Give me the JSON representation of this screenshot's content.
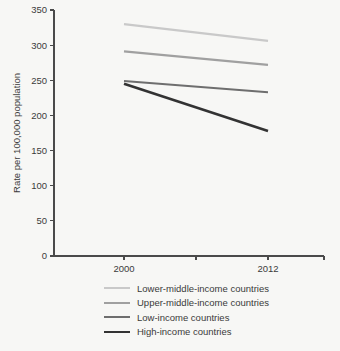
{
  "chart_data": {
    "type": "line",
    "title": "",
    "xlabel": "",
    "ylabel": "Rate per 100,000 population",
    "x": [
      "2000",
      "2012"
    ],
    "xtick_labels": [
      "2000",
      "2012"
    ],
    "ytick_labels": [
      "0",
      "50",
      "100",
      "150",
      "200",
      "250",
      "300",
      "350"
    ],
    "yticks": [
      0,
      50,
      100,
      150,
      200,
      250,
      300,
      350
    ],
    "ylim": [
      0,
      350
    ],
    "grid": false,
    "legend_position": "bottom",
    "series": [
      {
        "name": "Lower-middle-income countries",
        "values": [
          330,
          306
        ],
        "color": "#c9c9c9",
        "width": 2.2
      },
      {
        "name": "Upper-middle-income countries",
        "values": [
          291,
          272
        ],
        "color": "#a0a0a0",
        "width": 2.2
      },
      {
        "name": "Low-income countries",
        "values": [
          249,
          233
        ],
        "color": "#6e6e6e",
        "width": 2.2
      },
      {
        "name": "High-income countries",
        "values": [
          245,
          178
        ],
        "color": "#333333",
        "width": 2.6
      }
    ]
  },
  "legend": {
    "items": [
      {
        "label": "Lower-middle-income countries"
      },
      {
        "label": "Upper-middle-income countries"
      },
      {
        "label": "Low-income countries"
      },
      {
        "label": "High-income countries"
      }
    ]
  },
  "colors": {
    "background": "#f7f7f5",
    "axis": "#4a4a4a",
    "text": "#3b3b3b"
  }
}
